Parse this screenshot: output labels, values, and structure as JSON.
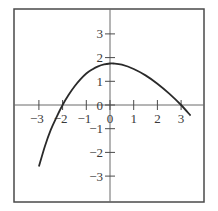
{
  "chart_data": {
    "type": "line",
    "title": "",
    "xlabel": "",
    "ylabel": "",
    "xlim": [
      -3.9,
      4.1
    ],
    "ylim": [
      -4.1,
      4.0
    ],
    "grid": false,
    "legend": null,
    "x_ticks": [
      -3,
      -2,
      -1,
      0,
      1,
      2,
      3
    ],
    "x_tick_labels": [
      "−3",
      "−2",
      "−1",
      "0",
      "1",
      "2",
      "3"
    ],
    "y_ticks": [
      3,
      2,
      1,
      0,
      -1,
      -2,
      -3
    ],
    "y_tick_labels": [
      "3",
      "2",
      "1",
      "0",
      "−1",
      "−2",
      "−3"
    ],
    "series": [
      {
        "name": "f(x)",
        "color": "#2a2a2a",
        "x": [
          -3.0,
          -2.75,
          -2.5,
          -2.25,
          -2.0,
          -1.75,
          -1.5,
          -1.25,
          -1.0,
          -0.75,
          -0.5,
          -0.25,
          0.0,
          0.15,
          0.5,
          1.0,
          1.5,
          2.0,
          2.5,
          3.0,
          3.4
        ],
        "y": [
          -2.6,
          -1.75,
          -1.05,
          -0.5,
          0.0,
          0.42,
          0.78,
          1.08,
          1.33,
          1.5,
          1.63,
          1.71,
          1.75,
          1.75,
          1.7,
          1.52,
          1.25,
          0.9,
          0.48,
          0.0,
          -0.45
        ]
      }
    ]
  }
}
